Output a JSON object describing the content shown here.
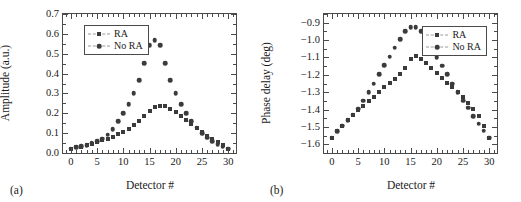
{
  "figure": {
    "panels": [
      {
        "sublabel": "(a)",
        "xlabel": "Detector #",
        "ylabel": "Amplitude (a.u.)",
        "xticks": [
          "0",
          "5",
          "10",
          "15",
          "20",
          "25",
          "30"
        ],
        "yticks": [
          "0.0",
          "0.1",
          "0.2",
          "0.3",
          "0.4",
          "0.5",
          "0.6",
          "0.7"
        ],
        "legend": [
          "RA",
          "No RA"
        ]
      },
      {
        "sublabel": "(b)",
        "xlabel": "Detector #",
        "ylabel": "Phase delay (deg)",
        "xticks": [
          "0",
          "5",
          "10",
          "15",
          "20",
          "25",
          "30"
        ],
        "yticks": [
          "−1.6",
          "−1.5",
          "−1.4",
          "−1.3",
          "−1.2",
          "−1.1",
          "−1.0",
          "−0.9"
        ],
        "legend": [
          "RA",
          "No RA"
        ]
      }
    ],
    "marker_color": "#3b3b3b",
    "axis_color": "#4a4a4a",
    "background": "#ffffff"
  },
  "chart_data": [
    {
      "type": "scatter",
      "panel": "(a)",
      "title": "",
      "xlabel": "Detector #",
      "ylabel": "Amplitude (a.u.)",
      "xlim": [
        -1.5,
        31.5
      ],
      "ylim": [
        0.0,
        0.7
      ],
      "xticks": [
        0,
        5,
        10,
        15,
        20,
        25,
        30
      ],
      "yticks": [
        0.0,
        0.1,
        0.2,
        0.3,
        0.4,
        0.5,
        0.6,
        0.7
      ],
      "grid": false,
      "legend_position": "upper-left",
      "x": [
        0,
        1,
        2,
        3,
        4,
        5,
        6,
        7,
        8,
        9,
        10,
        11,
        12,
        13,
        14,
        15,
        16,
        17,
        18,
        19,
        20,
        21,
        22,
        23,
        24,
        25,
        26,
        27,
        28,
        29,
        30
      ],
      "series": [
        {
          "name": "RA",
          "marker": "square",
          "values": [
            0.022,
            0.028,
            0.032,
            0.038,
            0.045,
            0.055,
            0.063,
            0.072,
            0.082,
            0.095,
            0.108,
            0.122,
            0.14,
            0.16,
            0.185,
            0.21,
            0.232,
            0.238,
            0.236,
            0.222,
            0.205,
            0.185,
            0.165,
            0.145,
            0.125,
            0.105,
            0.088,
            0.072,
            0.055,
            0.04,
            0.022
          ]
        },
        {
          "name": "No RA",
          "marker": "circle",
          "values": [
            0.022,
            0.028,
            0.033,
            0.04,
            0.048,
            0.058,
            0.072,
            0.092,
            0.12,
            0.16,
            0.2,
            0.245,
            0.3,
            0.367,
            0.452,
            0.543,
            0.568,
            0.543,
            0.452,
            0.367,
            0.3,
            0.245,
            0.2,
            0.16,
            0.128,
            0.1,
            0.078,
            0.06,
            0.045,
            0.032,
            0.022
          ]
        }
      ]
    },
    {
      "type": "scatter",
      "panel": "(b)",
      "title": "",
      "xlabel": "Detector #",
      "ylabel": "Phase delay (deg)",
      "xlim": [
        -1.5,
        31.5
      ],
      "ylim": [
        -1.65,
        -0.85
      ],
      "xticks": [
        0,
        5,
        10,
        15,
        20,
        25,
        30
      ],
      "yticks": [
        -1.6,
        -1.5,
        -1.4,
        -1.3,
        -1.2,
        -1.1,
        -1.0,
        -0.9
      ],
      "grid": false,
      "legend_position": "upper-right",
      "x": [
        0,
        1,
        2,
        3,
        4,
        5,
        6,
        7,
        8,
        9,
        10,
        11,
        12,
        13,
        14,
        15,
        16,
        17,
        18,
        19,
        20,
        21,
        22,
        23,
        24,
        25,
        26,
        27,
        28,
        29,
        30
      ],
      "series": [
        {
          "name": "RA",
          "marker": "square",
          "values": [
            -1.562,
            -1.525,
            -1.492,
            -1.462,
            -1.432,
            -1.405,
            -1.378,
            -1.352,
            -1.325,
            -1.298,
            -1.272,
            -1.248,
            -1.222,
            -1.198,
            -1.16,
            -1.11,
            -1.092,
            -1.108,
            -1.132,
            -1.16,
            -1.19,
            -1.218,
            -1.245,
            -1.272,
            -1.3,
            -1.33,
            -1.36,
            -1.398,
            -1.438,
            -1.492,
            -1.562
          ]
        },
        {
          "name": "No RA",
          "marker": "circle",
          "values": [
            -1.562,
            -1.525,
            -1.492,
            -1.462,
            -1.43,
            -1.395,
            -1.348,
            -1.3,
            -1.25,
            -1.198,
            -1.145,
            -1.095,
            -1.045,
            -0.995,
            -0.95,
            -0.925,
            -0.925,
            -0.95,
            -0.998,
            -1.048,
            -1.098,
            -1.148,
            -1.198,
            -1.25,
            -1.3,
            -1.348,
            -1.39,
            -1.438,
            -1.482,
            -1.522,
            -1.562
          ]
        }
      ]
    }
  ]
}
